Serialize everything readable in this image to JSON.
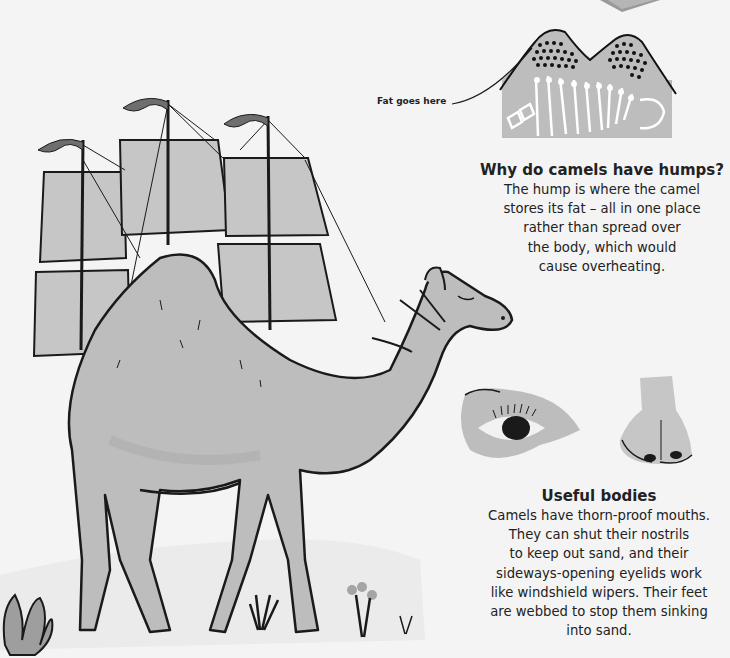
{
  "illustration": {
    "main_subject": "camel carrying ship sails (ship of the desert)",
    "detail_images": [
      "hump cross-section",
      "camel eye",
      "camel nose"
    ]
  },
  "hump_diagram": {
    "label": "Fat goes here"
  },
  "humps_section": {
    "heading": "Why do camels have humps?",
    "lines": [
      "The hump is where the camel",
      "stores its fat – all in one place",
      "rather than spread over",
      "the body, which would",
      "cause overheating."
    ]
  },
  "bodies_section": {
    "heading": "Useful bodies",
    "lines": [
      "Camels have thorn-proof mouths.",
      "They can shut their nostrils",
      "to keep out sand, and their",
      "sideways-opening eyelids work",
      "like windshield wipers. Their feet",
      "are webbed to stop them sinking",
      "into sand."
    ]
  },
  "colors": {
    "background": "#f4f4f4",
    "camel": "#bdbdbd",
    "sail": "#c6c6c6",
    "outline": "#1a1a1a",
    "flag": "#6e6e6e"
  }
}
